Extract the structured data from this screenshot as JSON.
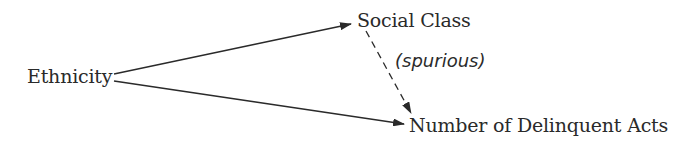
{
  "diagram": {
    "type": "causal-path-diagram",
    "nodes": {
      "ethnicity": {
        "label": "Ethnicity"
      },
      "social_class": {
        "label": "Social Class"
      },
      "delinquent_acts": {
        "label": "Number of Delinquent Acts"
      }
    },
    "edges": [
      {
        "from": "Ethnicity",
        "to": "Social Class",
        "style": "solid",
        "label": ""
      },
      {
        "from": "Ethnicity",
        "to": "Number of Delinquent Acts",
        "style": "solid",
        "label": ""
      },
      {
        "from": "Social Class",
        "to": "Number of Delinquent Acts",
        "style": "dashed",
        "label": "(spurious)"
      }
    ],
    "edge_labels": {
      "spurious": "(spurious)"
    },
    "colors": {
      "text": "#2a2a2a",
      "line": "#2a2a2a",
      "background": "#ffffff"
    }
  }
}
